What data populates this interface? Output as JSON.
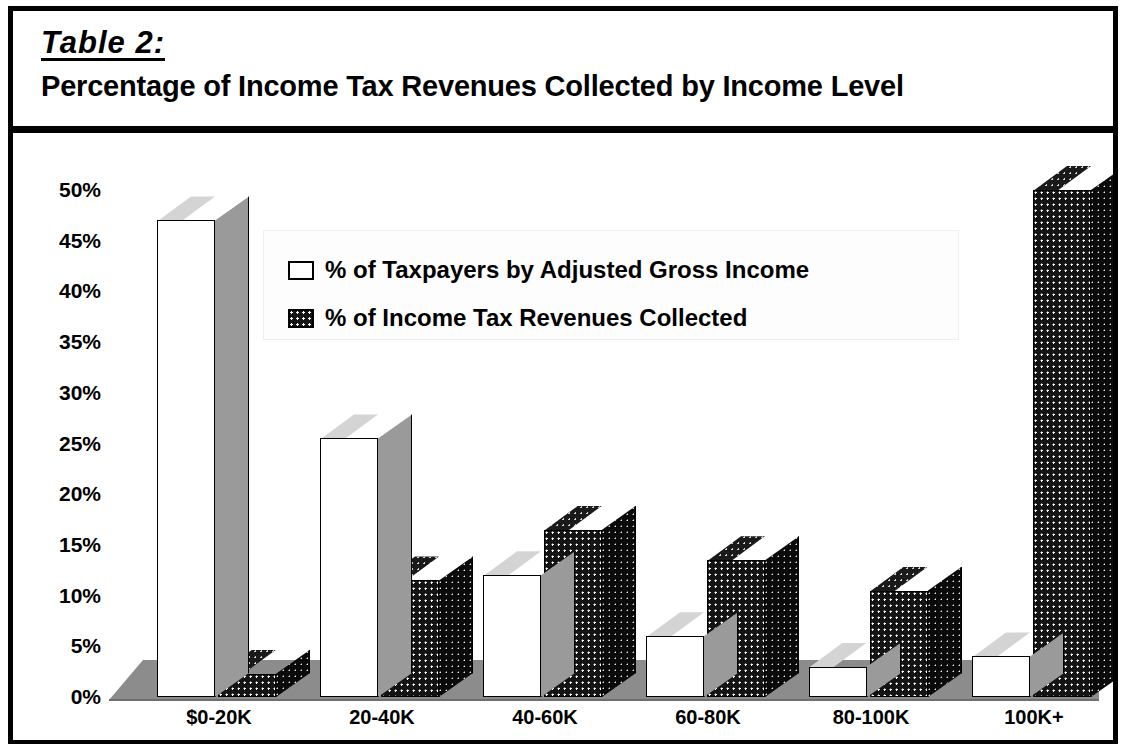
{
  "header": {
    "table_label": "Table 2:",
    "subtitle": "Percentage of Income Tax Revenues Collected by Income Level"
  },
  "legend": {
    "items": [
      {
        "label": "% of Taxpayers by Adjusted Gross Income",
        "swatch": "light-swatch-icon"
      },
      {
        "label": "% of Income Tax Revenues Collected",
        "swatch": "dark-swatch-icon"
      }
    ]
  },
  "axes": {
    "y_ticks": [
      "50%",
      "45%",
      "40%",
      "35%",
      "30%",
      "25%",
      "20%",
      "15%",
      "10%",
      "5%",
      "0%"
    ]
  },
  "chart_data": {
    "type": "bar",
    "title": "Percentage of Income Tax Revenues Collected by Income Level",
    "xlabel": "",
    "ylabel": "",
    "ylim": [
      0,
      50
    ],
    "ytick_step": 5,
    "grid": false,
    "legend_position": "upper-center",
    "categories": [
      "$0-20K",
      "20-40K",
      "40-60K",
      "60-80K",
      "80-100K",
      "100K+"
    ],
    "series": [
      {
        "name": "% of Taxpayers by Adjusted Gross Income",
        "style": "light",
        "values": [
          47,
          25.5,
          12,
          6,
          3,
          4
        ]
      },
      {
        "name": "% of Income Tax Revenues Collected",
        "style": "dark",
        "values": [
          2.3,
          11.5,
          16.5,
          13.5,
          10.5,
          50
        ]
      }
    ]
  }
}
